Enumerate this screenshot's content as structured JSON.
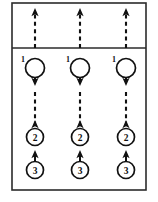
{
  "diagram": {
    "frame": {
      "x": 12,
      "y": 3,
      "width": 134,
      "height": 187,
      "stroke_color": "#2b2b2b"
    },
    "divider": {
      "y": 48,
      "x_start": 12,
      "x_end": 146,
      "stroke_color": "#2b2b2b"
    },
    "line_color": "#111111",
    "background_color": "#ffffff",
    "columns": [
      {
        "name": "column-left",
        "cx": 35
      },
      {
        "name": "column-center",
        "cx": 80
      },
      {
        "name": "column-right",
        "cx": 126
      }
    ],
    "nodes": [
      {
        "id": "node-1",
        "label": "1",
        "cy": 68,
        "radius": 9.5,
        "tick_label": "1",
        "tick_dx": -12,
        "tick_dy": -9
      },
      {
        "id": "node-2",
        "label": "2",
        "cy": 137,
        "radius": 8.5,
        "tick_label": "",
        "tick_dx": 0,
        "tick_dy": 0
      },
      {
        "id": "node-3",
        "label": "3",
        "cy": 170,
        "radius": 8.5,
        "tick_label": "",
        "tick_dx": 0,
        "tick_dy": 0
      }
    ],
    "arrows": {
      "top_dashed_up": {
        "y_top": 11,
        "y_bottom": 48,
        "style": "dashed",
        "direction": "up"
      },
      "inside_node1_up": {
        "y_top": 61,
        "y_bottom": 77,
        "style": "solid",
        "direction": "up"
      },
      "below_node1_down": {
        "y_top": 68,
        "y_bottom": 85,
        "style": "solid",
        "direction": "down"
      },
      "node1_to_node2_dashed": {
        "y_top": 88,
        "y_bottom": 128,
        "style": "dashed",
        "direction": "up"
      },
      "above_node3_up": {
        "y_top": 152,
        "y_bottom": 161,
        "style": "solid",
        "direction": "up"
      }
    }
  }
}
